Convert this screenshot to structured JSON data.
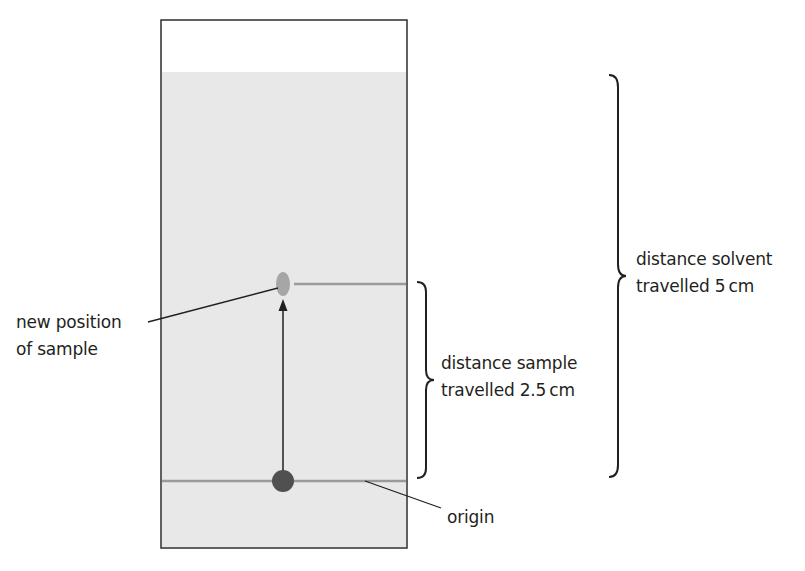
{
  "diagram": {
    "colors": {
      "paper_fill": "#e8e8e8",
      "paper_border": "#3a3a3a",
      "lines": "#9a9a9a",
      "sample_spot_moved": "#a6a6a6",
      "sample_spot_origin": "#505050",
      "arrow": "#231f20",
      "text": "#231f20"
    },
    "labels": {
      "new_position": {
        "line1": "new position",
        "line2": "of sample"
      },
      "sample_distance": {
        "line1": "distance sample",
        "line2": "travelled 2.5 cm"
      },
      "solvent_distance": {
        "line1": "distance solvent",
        "line2": "travelled 5 cm"
      },
      "origin": "origin"
    },
    "values": {
      "sample_distance_cm": 2.5,
      "solvent_distance_cm": 5,
      "unit": "cm"
    }
  }
}
